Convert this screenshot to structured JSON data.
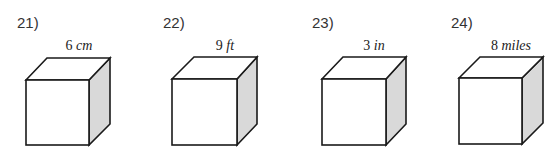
{
  "worksheet": {
    "problems": [
      {
        "number": "21)",
        "digit": "6",
        "unit": "cm",
        "label": "6 cm"
      },
      {
        "number": "22)",
        "digit": "9",
        "unit": "ft",
        "label": "9 ft"
      },
      {
        "number": "23)",
        "digit": "3",
        "unit": "in",
        "label": "3 in"
      },
      {
        "number": "24)",
        "digit": "8",
        "unit": "miles",
        "label": "8 miles"
      }
    ],
    "colors": {
      "stroke": "#1a1a1a",
      "side_face": "#d9d9d9",
      "front_face": "#ffffff"
    }
  }
}
